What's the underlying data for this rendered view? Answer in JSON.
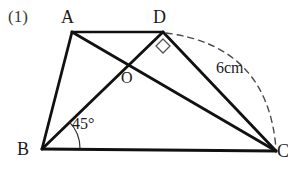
{
  "figure": {
    "problem_number": "(1)",
    "type": "geometry-diagram",
    "shape": "trapezoid-with-diagonals",
    "stroke_color": "#111111",
    "background_color": "#ffffff",
    "vertices": [
      {
        "name": "A",
        "label": "A",
        "x": 72,
        "y": 32
      },
      {
        "name": "D",
        "label": "D",
        "x": 163,
        "y": 32
      },
      {
        "name": "B",
        "label": "B",
        "x": 42,
        "y": 149
      },
      {
        "name": "C",
        "label": "C",
        "x": 275,
        "y": 151
      },
      {
        "name": "O",
        "label": "O",
        "x": 128,
        "y": 66
      }
    ],
    "segments": [
      {
        "name": "AD",
        "from": "A",
        "to": "D",
        "style": "solid"
      },
      {
        "name": "AB",
        "from": "A",
        "to": "B",
        "style": "solid"
      },
      {
        "name": "BC",
        "from": "B",
        "to": "C",
        "style": "solid"
      },
      {
        "name": "DC",
        "from": "D",
        "to": "C",
        "style": "solid"
      },
      {
        "name": "AC",
        "from": "A",
        "to": "C",
        "style": "solid"
      },
      {
        "name": "BD",
        "from": "B",
        "to": "D",
        "style": "solid"
      }
    ],
    "arc": {
      "name": "dashed-arc-D-to-C",
      "style": "dashed",
      "from": "D",
      "to": "C",
      "label": "6cm"
    },
    "angle_mark": {
      "name": "angle-45-at-B",
      "label": "45°",
      "vertex": "B",
      "value": 45,
      "unit": "degrees"
    },
    "right_angle_mark": {
      "name": "right-angle-at-D",
      "vertex": "D",
      "value": 90,
      "unit": "degrees"
    },
    "length_label": "6cm"
  }
}
